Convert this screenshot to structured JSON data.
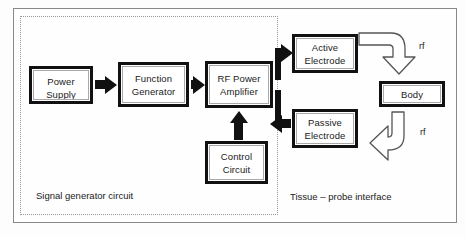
{
  "diagram": {
    "regions": [
      {
        "name": "signal-generator-circuit",
        "label": "Signal generator circuit"
      },
      {
        "name": "tissue-probe-interface",
        "label": "Tissue – probe interface"
      }
    ],
    "blocks": {
      "power_supply": {
        "line1": "Power",
        "line2": "Supply"
      },
      "function_generator": {
        "line1": "Function",
        "line2": "Generator"
      },
      "rf_power_amplifier": {
        "line1": "RF Power",
        "line2": "Amplifier"
      },
      "active_electrode": {
        "line1": "Active",
        "line2": "Electrode"
      },
      "passive_electrode": {
        "line1": "Passive",
        "line2": "Electrode"
      },
      "body": {
        "line1": "Body",
        "line2": ""
      },
      "control_circuit": {
        "line1": "Control",
        "line2": "Circuit"
      }
    },
    "signal_labels": {
      "rf_top": "rf",
      "rf_bottom": "rf"
    },
    "colors": {
      "block_border": "#111111",
      "block_inner_border": "#a9a9a9",
      "frame": "#888888",
      "dotted_region": "#9a9a9a",
      "text": "#1b1b1b",
      "background": "#ffffff"
    }
  }
}
